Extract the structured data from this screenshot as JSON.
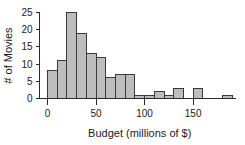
{
  "chart_data": {
    "type": "bar",
    "title": "",
    "xlabel": "Budget (millions of $)",
    "ylabel": "# of Movies",
    "xlim": [
      0,
      190
    ],
    "ylim": [
      0,
      26
    ],
    "grid": false,
    "legend": null,
    "bin_width": 10,
    "categories": [
      "0-10",
      "10-20",
      "20-30",
      "30-40",
      "40-50",
      "50-60",
      "60-70",
      "70-80",
      "80-90",
      "90-100",
      "100-110",
      "110-120",
      "120-130",
      "130-140",
      "140-150",
      "150-160",
      "160-170",
      "170-180",
      "180-190"
    ],
    "bin_starts": [
      0,
      10,
      20,
      30,
      40,
      50,
      60,
      70,
      80,
      90,
      100,
      110,
      120,
      130,
      140,
      150,
      160,
      170,
      180
    ],
    "values": [
      8,
      11,
      25,
      19,
      13,
      12,
      6,
      7,
      7,
      1,
      1,
      2,
      1,
      3,
      0,
      3,
      0,
      0,
      1
    ],
    "xticks": [
      0,
      50,
      100,
      150
    ],
    "xtick_labels": [
      "0",
      "50",
      "100",
      "150"
    ],
    "yticks": [
      0,
      5,
      10,
      15,
      20,
      25
    ],
    "ytick_labels": [
      "0",
      "5",
      "10",
      "15",
      "20",
      "25"
    ],
    "bar_fill_color": "#bdbdbd",
    "bar_edge_color": "#3a3a3a",
    "axis_color": "#2b2b2b"
  }
}
